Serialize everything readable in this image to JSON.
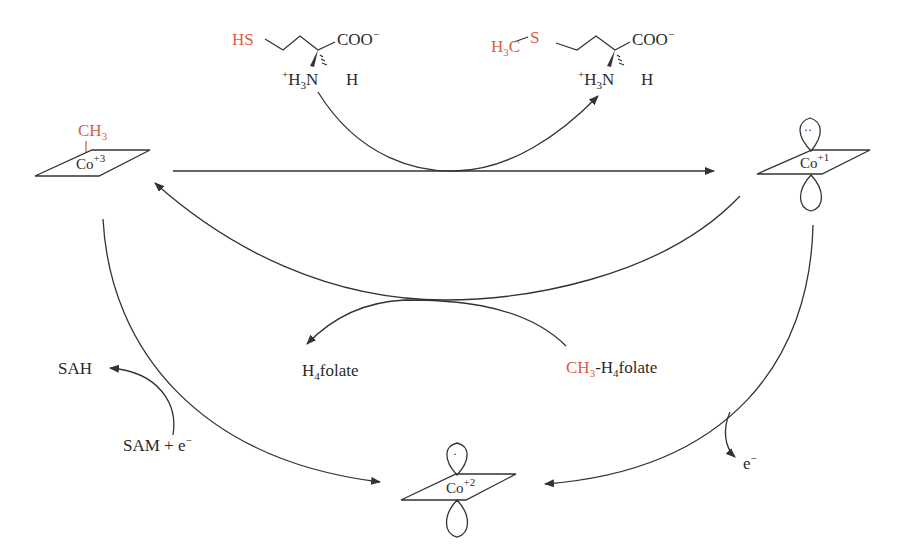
{
  "diagram": {
    "type": "catalytic cycle",
    "accent_color": "#d9603f",
    "homocysteine": {
      "thiol": "HS",
      "carboxylate": "COO",
      "carboxylate_charge": "−",
      "amine_prefix": "+",
      "amine_h": "H",
      "amine_sub": "3",
      "amine_n": "N",
      "alpha_h": "H"
    },
    "methionine": {
      "methyl_h": "H",
      "methyl_sub": "3",
      "methyl_c": "C",
      "sulfur": "S",
      "carboxylate": "COO",
      "carboxylate_charge": "−",
      "amine_prefix": "+",
      "amine_h": "H",
      "amine_sub": "3",
      "amine_n": "N",
      "alpha_h": "H"
    },
    "nodes": {
      "methylcobalamin": {
        "methyl": "CH",
        "methyl_sub": "3",
        "metal": "Co",
        "charge": "+3"
      },
      "cob_I": {
        "metal": "Co",
        "charge": "+1",
        "orbital_label": "··"
      },
      "cob_II": {
        "metal": "Co",
        "charge": "+2",
        "orbital_label": "·"
      }
    },
    "cofactors": {
      "h4folate": {
        "h": "H",
        "sub": "4",
        "rest": "folate"
      },
      "ch3_h4folate": {
        "methyl": "CH",
        "methyl_sub": "3",
        "dash": "-",
        "h": "H",
        "sub": "4",
        "rest": "folate"
      },
      "sah": "SAH",
      "sam": "SAM + e",
      "sam_charge": "−",
      "electron": "e",
      "electron_charge": "−"
    }
  }
}
